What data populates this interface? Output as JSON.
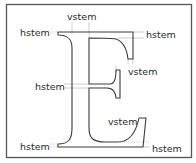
{
  "diagram": {
    "letter": "E",
    "frame_color": "#555555",
    "outline_color": "#3a3a3a",
    "guide_color": "#b8b8b8",
    "labels": [
      {
        "id": "top-vstem",
        "text": "vstem"
      },
      {
        "id": "top-left-hstem",
        "text": "hstem"
      },
      {
        "id": "top-right-hstem",
        "text": "hstem"
      },
      {
        "id": "mid-right-vstem",
        "text": "vstem"
      },
      {
        "id": "mid-left-hstem",
        "text": "hstem"
      },
      {
        "id": "bottom-vstem",
        "text": "vstem"
      },
      {
        "id": "bottom-left-hstem",
        "text": "hstem"
      },
      {
        "id": "bottom-right-hstem",
        "text": "hstem"
      }
    ]
  }
}
